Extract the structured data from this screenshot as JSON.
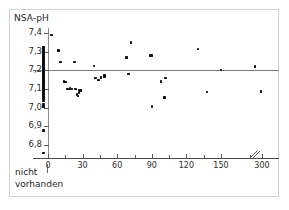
{
  "figure": {
    "axis_title_y": "NSA-pH",
    "note_line1": "nicht",
    "note_line2": "vorhanden",
    "point_color": "#101010",
    "axis_color": "#4a4a4a",
    "reference_line_color": "#7a7a7a",
    "frame_color": "#d2d2d2",
    "background": "#ffffff"
  },
  "chart_data": {
    "type": "scatter",
    "title": "",
    "subtitle": "",
    "xlabel": "",
    "ylabel": "NSA-pH",
    "grid": false,
    "legend": null,
    "xlim": [
      -12,
      310
    ],
    "ylim": [
      6.75,
      7.45
    ],
    "y_ticks": [
      "7,4",
      "7,3",
      "7,2",
      "7,1",
      "7,0",
      "6,9",
      "6,8"
    ],
    "y_tick_values": [
      7.4,
      7.3,
      7.2,
      7.1,
      7.0,
      6.9,
      6.8
    ],
    "x_ticks": [
      "0",
      "30",
      "60",
      "90",
      "120",
      "150",
      "300"
    ],
    "x_tick_values": [
      0,
      30,
      60,
      90,
      120,
      150,
      300
    ],
    "x_minor_tick_values": [
      15,
      45,
      75,
      105,
      135,
      165
    ],
    "axis_break": {
      "label": "//",
      "after_value": 150,
      "before_value": 300
    },
    "reference_lines": [
      {
        "orientation": "horizontal",
        "y": 7.2,
        "label": ""
      }
    ],
    "categorical_x_group": {
      "label": "nicht vorhanden",
      "x_value": -4,
      "n_points": 53
    },
    "annotations": [
      {
        "text": "nicht",
        "x": -11,
        "y": 6.72
      },
      {
        "text": "vorhanden",
        "x": -11,
        "y": 6.685
      }
    ],
    "series": [
      {
        "name": "nicht vorhanden",
        "x": [
          -4,
          -4,
          -4,
          -4,
          -4,
          -4,
          -4,
          -4,
          -4,
          -4,
          -4,
          -4,
          -4,
          -4,
          -4,
          -4,
          -4,
          -4,
          -4,
          -4,
          -4,
          -4,
          -4,
          -4,
          -4,
          -4,
          -4,
          -4,
          -4,
          -4,
          -4,
          -4,
          -4,
          -4,
          -4,
          -4,
          -4,
          -4,
          -4,
          -4,
          -4,
          -4,
          -4,
          -4,
          -4,
          -4,
          -4,
          -4,
          -4,
          -4,
          -4,
          -4,
          -4
        ],
        "y": [
          7.325,
          7.322,
          7.318,
          7.305,
          7.3,
          7.297,
          7.293,
          7.29,
          7.286,
          7.28,
          7.276,
          7.272,
          7.268,
          7.262,
          7.255,
          7.25,
          7.244,
          7.238,
          7.232,
          7.226,
          7.22,
          7.214,
          7.208,
          7.204,
          7.2,
          7.196,
          7.192,
          7.188,
          7.184,
          7.18,
          7.176,
          7.17,
          7.164,
          7.158,
          7.152,
          7.146,
          7.14,
          7.132,
          7.124,
          7.116,
          7.108,
          7.1,
          7.092,
          7.084,
          7.076,
          7.068,
          7.06,
          7.048,
          7.036,
          7.02,
          7.006,
          6.877,
          6.758
        ]
      },
      {
        "name": "Messwerte",
        "x": [
          3,
          9,
          11,
          14,
          15,
          17,
          19,
          21,
          23,
          24,
          25,
          26,
          27,
          27,
          28,
          40,
          41,
          44,
          46,
          49,
          49,
          68,
          70,
          72,
          89,
          90,
          90,
          98,
          101,
          102,
          130,
          138,
          150,
          220,
          290
        ],
        "y": [
          7.388,
          7.306,
          7.244,
          7.139,
          7.137,
          7.1,
          7.102,
          7.1,
          7.245,
          7.1,
          7.07,
          7.062,
          7.08,
          7.095,
          7.092,
          7.224,
          7.16,
          7.147,
          7.162,
          7.172,
          7.165,
          7.27,
          7.18,
          7.35,
          7.279,
          7.007,
          7.279,
          7.14,
          7.055,
          7.158,
          7.313,
          7.085,
          7.201,
          7.221,
          7.086
        ]
      }
    ]
  }
}
